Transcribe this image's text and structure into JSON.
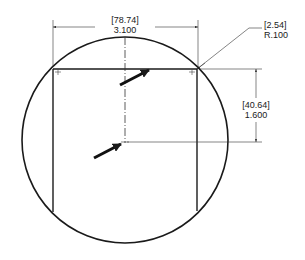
{
  "drawing": {
    "type": "engineering-drawing",
    "stroke_color": "#1a1a1a",
    "background": "#ffffff",
    "dimensions": {
      "width": {
        "metric": "[78.74]",
        "imperial": "3.100"
      },
      "height": {
        "metric": "[40.64]",
        "imperial": "1.600"
      },
      "radius": {
        "metric": "[2.54]",
        "imperial": "R.100"
      }
    },
    "annotations": {
      "upper_arrow": "arrow-pointing-to-top-edge",
      "lower_arrow": "arrow-pointing-to-center-point"
    }
  }
}
